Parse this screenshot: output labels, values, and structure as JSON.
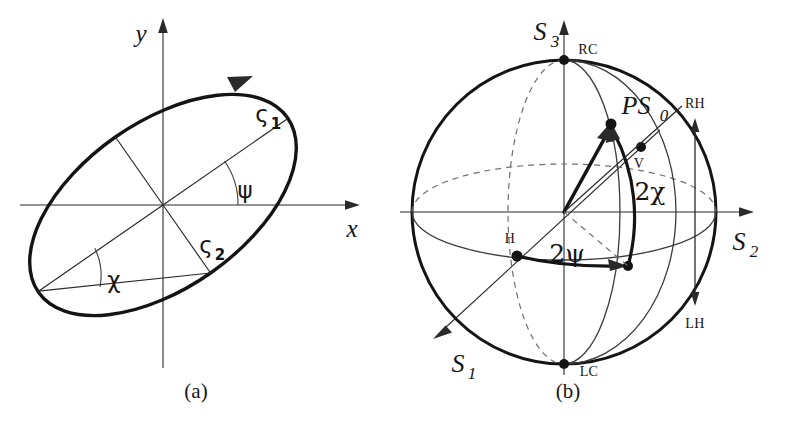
{
  "figure": {
    "background_color": "#ffffff",
    "ink_color": "#141414",
    "panels": [
      {
        "id": "a",
        "caption": "(a)",
        "title": "polarization ellipse",
        "axes": [
          {
            "name": "x-axis",
            "label": "x",
            "direction": "right"
          },
          {
            "name": "y-axis",
            "label": "y",
            "direction": "up"
          }
        ],
        "labels": {
          "semi_major": "ς",
          "semi_major_sub": "1",
          "semi_minor": "ς",
          "semi_minor_sub": "2",
          "orientation_angle": "ψ",
          "ellipticity_angle": "χ"
        },
        "geometry": {
          "center": [
            163,
            205
          ],
          "semi_major_px": 152,
          "semi_minor_px": 83,
          "tilt_deg": 35,
          "rotation_sense": "counterclockwise",
          "psi_deg": 35,
          "chi_deg": 15
        }
      },
      {
        "id": "b",
        "caption": "(b)",
        "title": "Poincare sphere",
        "axes": [
          {
            "name": "s1-axis",
            "label": "S",
            "sub": "1",
            "direction": "lower-left"
          },
          {
            "name": "s2-axis",
            "label": "S",
            "sub": "2",
            "direction": "right"
          },
          {
            "name": "s3-axis",
            "label": "S",
            "sub": "3",
            "direction": "up"
          }
        ],
        "points": [
          {
            "name": "rc-pole",
            "label": "RC",
            "meaning": "right circular"
          },
          {
            "name": "lc-pole",
            "label": "LC",
            "meaning": "left circular"
          },
          {
            "name": "h-point",
            "label": "H",
            "meaning": "horizontal linear"
          },
          {
            "name": "v-point",
            "label": "V",
            "meaning": "vertical linear"
          },
          {
            "name": "state-vector-tip",
            "label": "PS",
            "sub": "0",
            "meaning": "polarization state"
          }
        ],
        "angles": [
          {
            "name": "two-chi",
            "label": "2χ"
          },
          {
            "name": "two-psi",
            "label": "2ψ"
          }
        ],
        "handedness": {
          "upper_label": "RH",
          "lower_label": "LH"
        },
        "geometry": {
          "center": [
            172,
            212
          ],
          "radius": 152,
          "two_psi_deg": 50,
          "two_chi_deg": 30
        }
      }
    ]
  }
}
